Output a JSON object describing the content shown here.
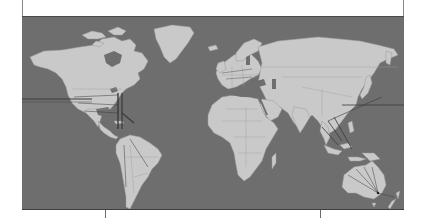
{
  "figure": {
    "type": "world-map",
    "style": "grayscale",
    "colors": {
      "ocean": "#6e6e6e",
      "land": "#c9c9c9",
      "borders": "#8f8f8f",
      "routes": "#3a3a3a",
      "frame": "#8a8a8a",
      "background": "#ffffff"
    },
    "icons": {
      "map": "world-map-icon"
    }
  },
  "ticks": {
    "positions_px": [
      105,
      320
    ]
  },
  "routes": {
    "description": "dark network/cable lines",
    "segments": [
      "transatlantic-horizontal-line",
      "north-america-east-coast-vertical-lines",
      "southeast-asia-route-lines",
      "australia-fan-lines",
      "trans-pacific-horizontal-line"
    ]
  }
}
